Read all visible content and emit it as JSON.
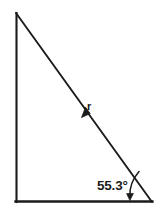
{
  "figure": {
    "background_color": "#ffffff",
    "stroke_color": "#1b1b1b",
    "labels": {
      "angle": "55.3°",
      "angle_value": 55.3,
      "angle_unit": "degrees",
      "vector": "r"
    },
    "geometry": {
      "apex": {
        "x": 16,
        "y": 13
      },
      "bottom_left": {
        "x": 16,
        "y": 202
      },
      "bottom_right": {
        "x": 152,
        "y": 202
      },
      "vertical_leg_length_px": 189,
      "horizontal_leg_length_px": 136,
      "hypotenuse_label_position": {
        "x": 88,
        "y": 106
      },
      "angle_vertex": {
        "x": 152,
        "y": 202
      }
    },
    "annotations": {
      "vector_arrow_direction": "down-left along hypotenuse toward apex",
      "angle_leader": "curved arrow from hypotenuse to base at right vertex"
    }
  }
}
